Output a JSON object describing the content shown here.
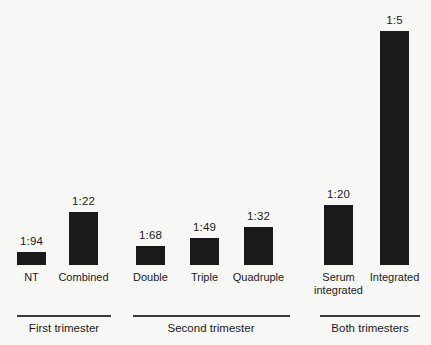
{
  "chart_data": {
    "type": "bar",
    "title": "",
    "subtitle": "",
    "xlabel": "",
    "ylabel": "",
    "grid": false,
    "legend": null,
    "axis_visible": false,
    "value_format": "ratio 1:N (detection odds)",
    "bar_color": "#1a1a1a",
    "background_color": "#f7f7f5",
    "categories": [
      "NT",
      "Combined",
      "Double",
      "Triple",
      "Quadruple",
      "Serum integrated",
      "Integrated"
    ],
    "value_labels": [
      "1:94",
      "1:22",
      "1:68",
      "1:49",
      "1:32",
      "1:20",
      "1:5"
    ],
    "values": [
      94,
      22,
      68,
      49,
      32,
      20,
      5
    ],
    "bars": [
      {
        "category": "NT",
        "label_lines": [
          "NT"
        ],
        "value_label": "1:94",
        "value": 94,
        "group": "First trimester",
        "x": 17,
        "width": 29,
        "top": 252,
        "height": 13
      },
      {
        "category": "Combined",
        "label_lines": [
          "Combined"
        ],
        "value_label": "1:22",
        "value": 22,
        "group": "First trimester",
        "x": 69,
        "width": 29,
        "top": 212,
        "height": 53
      },
      {
        "category": "Double",
        "label_lines": [
          "Double"
        ],
        "value_label": "1:68",
        "value": 68,
        "group": "Second trimester",
        "x": 136,
        "width": 29,
        "top": 246,
        "height": 19
      },
      {
        "category": "Triple",
        "label_lines": [
          "Triple"
        ],
        "value_label": "1:49",
        "value": 49,
        "group": "Second trimester",
        "x": 190,
        "width": 29,
        "top": 238,
        "height": 27
      },
      {
        "category": "Quadruple",
        "label_lines": [
          "Quadruple"
        ],
        "value_label": "1:32",
        "value": 32,
        "group": "Second trimester",
        "x": 244,
        "width": 29,
        "top": 227,
        "height": 38
      },
      {
        "category": "Serum integrated",
        "label_lines": [
          "Serum",
          "integrated"
        ],
        "value_label": "1:20",
        "value": 20,
        "group": "Both trimesters",
        "x": 324,
        "width": 29,
        "top": 205,
        "height": 60
      },
      {
        "category": "Integrated",
        "label_lines": [
          "Integrated"
        ],
        "value_label": "1:5",
        "value": 5,
        "group": "Both trimesters",
        "x": 380,
        "width": 29,
        "top": 31,
        "height": 234
      }
    ],
    "groups": [
      {
        "label": "First trimester",
        "rule_x": 17,
        "rule_width": 94,
        "center": 64
      },
      {
        "label": "Second trimester",
        "rule_x": 133,
        "rule_width": 157,
        "center": 211
      },
      {
        "label": "Both trimesters",
        "rule_x": 320,
        "rule_width": 100,
        "center": 370
      }
    ]
  }
}
